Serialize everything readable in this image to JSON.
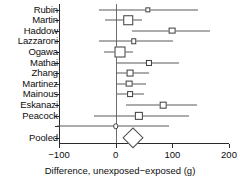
{
  "chart_data": {
    "type": "forest",
    "title": "",
    "xlabel": "Difference, unexposed−exposed (g)",
    "ylabel": "",
    "xlim": [
      -100,
      200
    ],
    "xticks": [
      -100,
      0,
      100,
      200
    ],
    "xtick_labels": [
      "−100",
      "0",
      "100",
      "200"
    ],
    "grid": false,
    "zero_reference": 0,
    "marker_shape_note": "open squares sized by study weight; open diamond for pooled estimate",
    "categories": [
      "Rubin",
      "Martin",
      "Haddow",
      "Lazzaroni",
      "Ogawa",
      "Mathai",
      "Zhang",
      "Martinez",
      "Mainous",
      "Eskanazi",
      "Peacock",
      "Pooled"
    ],
    "studies": [
      {
        "name": "Rubin",
        "estimate": 57,
        "ci_low": -30,
        "ci_high": 146,
        "weight": 0.18,
        "marker": "square"
      },
      {
        "name": "Martin",
        "estimate": 22,
        "ci_low": -18,
        "ci_high": 47,
        "weight": 0.78,
        "marker": "square"
      },
      {
        "name": "Haddow",
        "estimate": 99,
        "ci_low": 28,
        "ci_high": 166,
        "weight": 0.4,
        "marker": "square"
      },
      {
        "name": "Lazzaroni",
        "estimate": 32,
        "ci_low": -30,
        "ci_high": 102,
        "weight": 0.22,
        "marker": "square"
      },
      {
        "name": "Ogawa",
        "estimate": 7,
        "ci_low": -20,
        "ci_high": 30,
        "weight": 1.0,
        "marker": "square"
      },
      {
        "name": "Mathai",
        "estimate": 59,
        "ci_low": 2,
        "ci_high": 112,
        "weight": 0.3,
        "marker": "square"
      },
      {
        "name": "Zhang",
        "estimate": 26,
        "ci_low": 0,
        "ci_high": 58,
        "weight": 0.42,
        "marker": "square"
      },
      {
        "name": "Martinez",
        "estimate": 24,
        "ci_low": 0,
        "ci_high": 54,
        "weight": 0.4,
        "marker": "square"
      },
      {
        "name": "Mainous",
        "estimate": 26,
        "ci_low": 2,
        "ci_high": 50,
        "weight": 0.25,
        "marker": "square"
      },
      {
        "name": "Eskanazi",
        "estimate": 84,
        "ci_low": 18,
        "ci_high": 144,
        "weight": 0.38,
        "marker": "square"
      },
      {
        "name": "Peacock",
        "estimate": 41,
        "ci_low": -38,
        "ci_high": 130,
        "weight": 0.62,
        "marker": "square"
      },
      {
        "name": "",
        "estimate": 0,
        "ci_low": -104,
        "ci_high": 94,
        "weight": 0.22,
        "marker": "circle"
      }
    ],
    "pooled": {
      "label": "Pooled",
      "estimate": 31,
      "ci_low": 12,
      "ci_high": 50,
      "marker": "diamond"
    }
  },
  "axis": {
    "x_title": "Difference, unexposed−exposed (g)",
    "tick_labels": [
      "−100",
      "0",
      "100",
      "200"
    ]
  },
  "labels": {
    "rows": [
      "Rubin",
      "Martin",
      "Haddow",
      "Lazzaroni",
      "Ogawa",
      "Mathai",
      "Zhang",
      "Martinez",
      "Mainous",
      "Eskanazi",
      "Peacock"
    ],
    "pooled": "Pooled"
  },
  "colors": {
    "axis": "#2b2b2b",
    "line": "#5a5a5a",
    "marker_stroke": "#3c3c3c",
    "marker_fill": "#ffffff",
    "zero_line": "#6e6e6e",
    "text": "#0d0d0d",
    "background": "#ffffff"
  }
}
